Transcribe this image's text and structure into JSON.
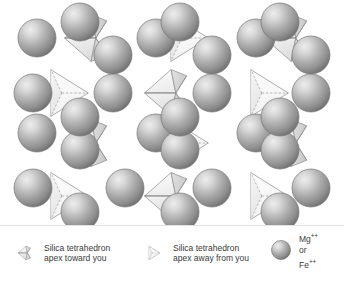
{
  "diagram": {
    "colors": {
      "sphere_highlight": "#e8e8e8",
      "sphere_mid": "#a8a8a8",
      "sphere_edge": "#6e6e6e",
      "sphere_outline": "#767676",
      "tetra_face_light": "#fdfdfd",
      "tetra_face_mid": "#f0f0f0",
      "tetra_face_dark": "#d2d2d2",
      "tetra_outline": "#8a8a8a",
      "dashed_line": "#9a9a9a",
      "separator": "#e2e2e2",
      "text": "#3a3a3a",
      "background": "#ffffff"
    },
    "sphere_radius": 19,
    "tetra_size": 30,
    "spheres": [
      {
        "cx": 37,
        "cy": 38
      },
      {
        "cx": 113,
        "cy": 55
      },
      {
        "cx": 156,
        "cy": 38
      },
      {
        "cx": 212,
        "cy": 55
      },
      {
        "cx": 256,
        "cy": 38
      },
      {
        "cx": 311,
        "cy": 55
      },
      {
        "cx": 33,
        "cy": 93
      },
      {
        "cx": 113,
        "cy": 93
      },
      {
        "cx": 212,
        "cy": 93
      },
      {
        "cx": 311,
        "cy": 93
      },
      {
        "cx": 37,
        "cy": 133
      },
      {
        "cx": 80,
        "cy": 150
      },
      {
        "cx": 156,
        "cy": 133
      },
      {
        "cx": 180,
        "cy": 150
      },
      {
        "cx": 256,
        "cy": 133
      },
      {
        "cx": 280,
        "cy": 150
      },
      {
        "cx": 33,
        "cy": 188
      },
      {
        "cx": 125,
        "cy": 188
      },
      {
        "cx": 212,
        "cy": 188
      },
      {
        "cx": 311,
        "cy": 188
      },
      {
        "cx": 80,
        "cy": 22
      },
      {
        "cx": 180,
        "cy": 22
      },
      {
        "cx": 280,
        "cy": 22
      },
      {
        "cx": 80,
        "cy": 117
      },
      {
        "cx": 180,
        "cy": 117
      },
      {
        "cx": 280,
        "cy": 117
      },
      {
        "cx": 80,
        "cy": 212
      },
      {
        "cx": 180,
        "cy": 212
      },
      {
        "cx": 280,
        "cy": 212
      }
    ],
    "tetrahedra": [
      {
        "cx": 88,
        "cy": 38,
        "type": "toward"
      },
      {
        "cx": 188,
        "cy": 38,
        "type": "away"
      },
      {
        "cx": 288,
        "cy": 38,
        "type": "toward"
      },
      {
        "cx": 68,
        "cy": 93,
        "type": "away"
      },
      {
        "cx": 168,
        "cy": 93,
        "type": "toward"
      },
      {
        "cx": 268,
        "cy": 93,
        "type": "away"
      },
      {
        "cx": 88,
        "cy": 143,
        "type": "toward"
      },
      {
        "cx": 188,
        "cy": 143,
        "type": "away"
      },
      {
        "cx": 288,
        "cy": 143,
        "type": "toward"
      },
      {
        "cx": 68,
        "cy": 196,
        "type": "away"
      },
      {
        "cx": 168,
        "cy": 196,
        "type": "toward"
      },
      {
        "cx": 268,
        "cy": 196,
        "type": "away"
      }
    ]
  },
  "legend": {
    "items": [
      {
        "id": "toward",
        "glyph": "tetrahedron-apex-toward-icon",
        "line1": "Silica tetrahedron",
        "line2": "apex toward you"
      },
      {
        "id": "away",
        "glyph": "tetrahedron-apex-away-icon",
        "line1": "Silica tetrahedron",
        "line2": "apex away from you"
      }
    ],
    "cation": {
      "glyph": "cation-sphere-icon",
      "line1": "Mg",
      "line1_sup": "++",
      "line2": "or",
      "line3": "Fe",
      "line3_sup": "++"
    }
  }
}
